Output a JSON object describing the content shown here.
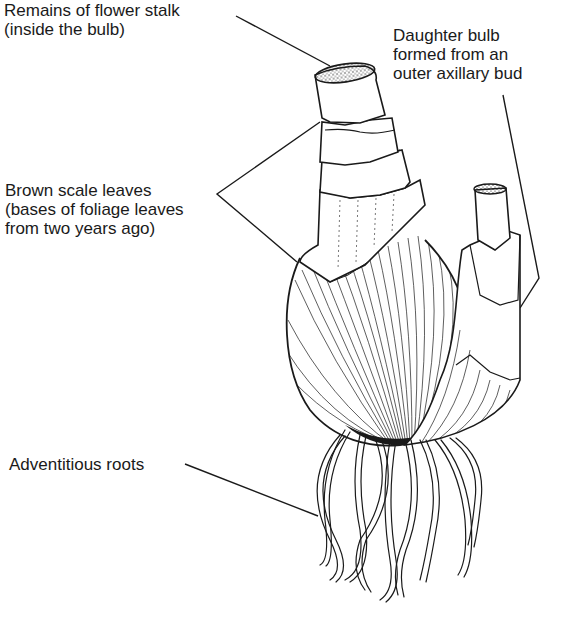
{
  "diagram": {
    "labels": [
      {
        "id": "flower-stalk",
        "lines": [
          "Remains of flower stalk",
          "(inside the bulb)"
        ]
      },
      {
        "id": "daughter-bulb",
        "lines": [
          "Daughter bulb",
          "formed from an",
          "outer axillary bud"
        ]
      },
      {
        "id": "scale-leaves",
        "lines": [
          "Brown scale leaves",
          "(bases of foliage leaves",
          "from two years ago)"
        ]
      },
      {
        "id": "roots",
        "lines": [
          "Adventitious roots"
        ]
      }
    ],
    "colors": {
      "ink": "#1a1a1a",
      "background": "#ffffff"
    }
  }
}
